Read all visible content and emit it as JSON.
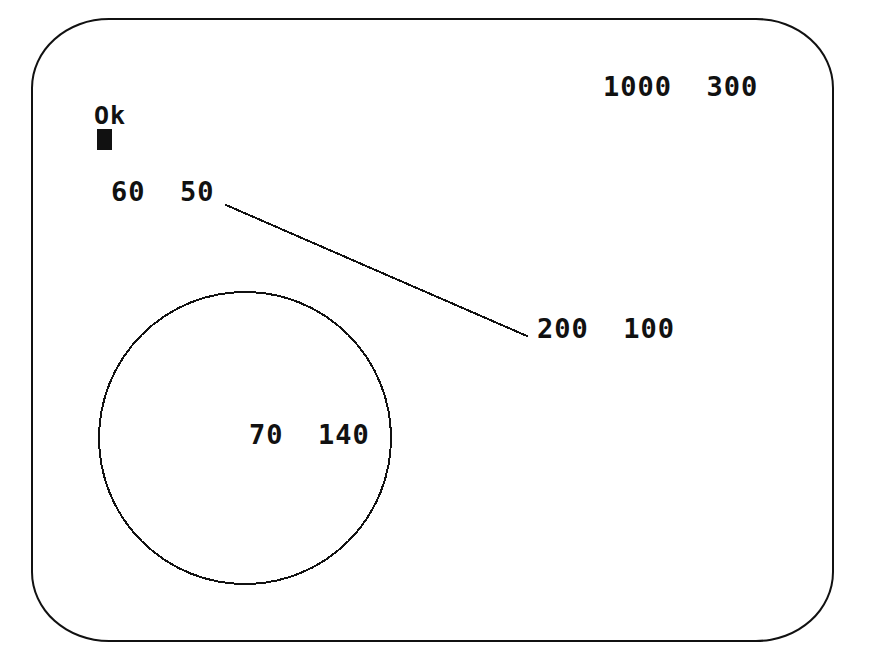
{
  "screen": {
    "device": "crt-monitor",
    "background_color": "#ffffff",
    "ink_color": "#111111",
    "prompt": "Ok",
    "cursor": "block-cursor"
  },
  "labels": {
    "topright": "1000  300",
    "line_start": "60  50",
    "line_end": "200  100",
    "circle_center": "70  140"
  },
  "graphics": {
    "line": {
      "name": "drawn-line",
      "x1": 226,
      "y1": 205,
      "x2": 527,
      "y2": 336,
      "stroke": "#111111",
      "width": 2
    },
    "circle": {
      "name": "drawn-circle",
      "cx": 245,
      "cy": 438,
      "r": 146,
      "stroke": "#111111",
      "width": 2,
      "fill": "none"
    }
  },
  "bezel": {
    "name": "crt-bezel",
    "stroke": "#111111"
  }
}
